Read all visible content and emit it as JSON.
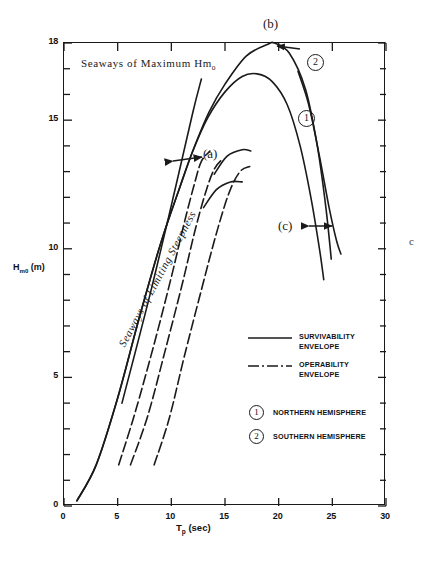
{
  "figure": {
    "background": "#ffffff",
    "ink_color": "#1a1a1a",
    "scan_mark": "c"
  },
  "axes": {
    "x_title": "T",
    "x_title_sub": "p",
    "x_title_unit": " (sec)",
    "y_title": "H",
    "y_title_sub": "m0",
    "y_title_unit": " (m)",
    "x_ticks": [
      "0",
      "5",
      "10",
      "15",
      "20",
      "25",
      "30"
    ],
    "y_ticks": [
      "0",
      "5",
      "10",
      "15",
      "18"
    ]
  },
  "annotations": {
    "a": "(a)",
    "b": "(b)",
    "c": "(c)",
    "max_hmo": "Seaways of  Maximum  Hm",
    "max_hmo_sub": "o",
    "limiting_steepness": "Seaways of Limiting Steepness",
    "badge_curve_1": "1",
    "badge_curve_2": "2"
  },
  "legend": {
    "entries": [
      {
        "style": "solid",
        "line1": "SURVIVABILITY",
        "line2": "ENVELOPE"
      },
      {
        "style": "dash-dot",
        "line1": "OPERABILITY",
        "line2": "ENVELOPE"
      }
    ],
    "hemispheres": [
      {
        "badge": "1",
        "label": "NORTHERN HEMISPHERE"
      },
      {
        "badge": "2",
        "label": "SOUTHERN HEMISPHERE"
      }
    ]
  },
  "chart_data": {
    "type": "line",
    "title": "",
    "xlabel": "Tp (sec)",
    "ylabel": "Hm0 (m)",
    "xlim": [
      0,
      30
    ],
    "ylim": [
      0,
      18
    ],
    "xticks": [
      0,
      5,
      10,
      15,
      20,
      25,
      30
    ],
    "yticks": [
      0,
      5,
      10,
      15,
      18
    ],
    "x_minor_tick_step": 1,
    "y_minor_tick_step": 1,
    "grid": false,
    "legend_position": "center-right",
    "series": [
      {
        "name": "Survivability envelope – Southern Hemisphere (2)",
        "style": "solid",
        "marker_label": "2",
        "points": [
          [
            1.2,
            0.2
          ],
          [
            3.0,
            1.6
          ],
          [
            5.0,
            4.2
          ],
          [
            7.0,
            7.3
          ],
          [
            9.0,
            10.2
          ],
          [
            10.8,
            12.4
          ],
          [
            12.0,
            13.8
          ],
          [
            13.5,
            15.3
          ],
          [
            15.0,
            16.4
          ],
          [
            17.0,
            17.5
          ],
          [
            19.0,
            17.95
          ],
          [
            19.6,
            18.0
          ],
          [
            21.0,
            17.6
          ],
          [
            22.5,
            16.2
          ],
          [
            23.6,
            14.0
          ],
          [
            24.4,
            11.6
          ],
          [
            24.9,
            9.6
          ]
        ]
      },
      {
        "name": "Survivability envelope – Northern Hemisphere (1)",
        "style": "solid",
        "marker_label": "1",
        "points": [
          [
            1.2,
            0.2
          ],
          [
            3.0,
            1.6
          ],
          [
            5.0,
            4.2
          ],
          [
            7.0,
            7.3
          ],
          [
            9.0,
            10.2
          ],
          [
            10.8,
            12.4
          ],
          [
            12.0,
            13.8
          ],
          [
            13.4,
            15.1
          ],
          [
            15.0,
            16.1
          ],
          [
            16.6,
            16.7
          ],
          [
            18.0,
            16.8
          ],
          [
            19.4,
            16.5
          ],
          [
            20.8,
            15.6
          ],
          [
            22.0,
            14.0
          ],
          [
            23.0,
            12.0
          ],
          [
            23.8,
            10.0
          ],
          [
            24.2,
            8.8
          ]
        ]
      },
      {
        "name": "Survivability outer right branch",
        "style": "solid",
        "points": [
          [
            21.8,
            16.9
          ],
          [
            22.8,
            15.6
          ],
          [
            23.8,
            13.6
          ],
          [
            24.7,
            11.6
          ],
          [
            25.4,
            10.3
          ],
          [
            25.8,
            9.8
          ]
        ]
      },
      {
        "name": "Limiting steepness guide line",
        "style": "solid",
        "points": [
          [
            5.4,
            4.0
          ],
          [
            8.0,
            8.2
          ],
          [
            10.4,
            12.4
          ],
          [
            12.0,
            15.3
          ],
          [
            12.8,
            16.6
          ]
        ]
      },
      {
        "name": "Operability envelope – inner (dash-dot)",
        "style": "dash-dot",
        "points": [
          [
            5.1,
            1.6
          ],
          [
            6.6,
            3.6
          ],
          [
            8.4,
            6.3
          ],
          [
            10.0,
            8.9
          ],
          [
            11.2,
            11.0
          ],
          [
            12.2,
            12.6
          ],
          [
            12.8,
            13.4
          ],
          [
            13.6,
            13.8
          ]
        ]
      },
      {
        "name": "Operability envelope – middle (dash-dot)",
        "style": "dash-dot",
        "points": [
          [
            6.2,
            1.6
          ],
          [
            7.8,
            3.5
          ],
          [
            9.4,
            6.0
          ],
          [
            11.0,
            8.6
          ],
          [
            12.2,
            10.7
          ],
          [
            13.2,
            12.2
          ],
          [
            14.0,
            13.1
          ],
          [
            14.8,
            13.5
          ]
        ]
      },
      {
        "name": "Operability envelope – outer (dash-dot)",
        "style": "dash-dot",
        "points": [
          [
            8.4,
            1.6
          ],
          [
            9.8,
            3.4
          ],
          [
            11.2,
            5.8
          ],
          [
            12.8,
            8.4
          ],
          [
            14.2,
            10.6
          ],
          [
            15.4,
            12.2
          ],
          [
            16.4,
            13.0
          ],
          [
            17.3,
            13.2
          ]
        ]
      },
      {
        "name": "Operability crest – upper cap",
        "style": "solid",
        "points": [
          [
            14.0,
            12.9
          ],
          [
            15.2,
            13.6
          ],
          [
            16.6,
            13.85
          ],
          [
            17.4,
            13.8
          ]
        ]
      },
      {
        "name": "Operability crest – lower cap",
        "style": "solid",
        "points": [
          [
            13.0,
            11.6
          ],
          [
            14.2,
            12.3
          ],
          [
            15.5,
            12.6
          ],
          [
            16.6,
            12.6
          ]
        ]
      }
    ],
    "callouts": [
      {
        "label": "(a)",
        "x": 13.2,
        "y": 13.8,
        "note": "Spread in survivability seaways at limiting steepness"
      },
      {
        "label": "(b)",
        "x": 19.6,
        "y": 18.0,
        "note": "Maximum Hm0 peak of survivability envelope"
      },
      {
        "label": "(c)",
        "x": 25.0,
        "y": 10.9,
        "note": "Spread at long period tail"
      }
    ]
  }
}
